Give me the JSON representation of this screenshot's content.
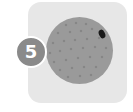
{
  "card": {
    "background": "#e7e7e7"
  },
  "badge": {
    "number": "5",
    "color": "#8a8a8a"
  },
  "ball": {
    "color": "#9a9a9a",
    "dot_color": "#858585",
    "hole_color": "#1a1a1a"
  }
}
